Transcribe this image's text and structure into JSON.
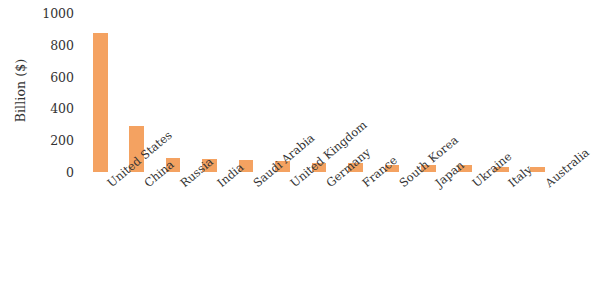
{
  "chart_data": {
    "type": "bar",
    "title": "",
    "xlabel": "",
    "ylabel": "Billion ($)",
    "ylim": [
      0,
      1000
    ],
    "yticks": [
      0,
      200,
      400,
      600,
      800,
      1000
    ],
    "grid": false,
    "legend": false,
    "bar_color": "#f4a261",
    "categories": [
      "United States",
      "China",
      "Russia",
      "India",
      "Saudi Arabia",
      "United Kingdom",
      "Germany",
      "France",
      "South Korea",
      "Japan",
      "Ukraine",
      "Italy",
      "Australia"
    ],
    "values": [
      877,
      292,
      86,
      81,
      75,
      68,
      56,
      54,
      46,
      46,
      44,
      33,
      32
    ]
  }
}
